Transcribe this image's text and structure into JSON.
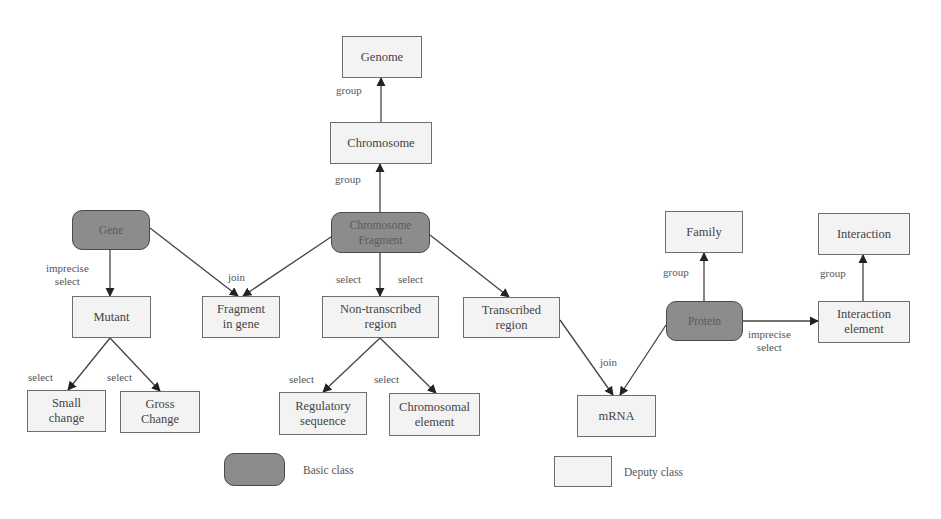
{
  "diagram": {
    "nodes": [
      {
        "id": "genome",
        "label": "Genome",
        "type": "deputy",
        "x": 342,
        "y": 36,
        "w": 80,
        "h": 42
      },
      {
        "id": "chromosome",
        "label": "Chromosome",
        "type": "deputy",
        "x": 330,
        "y": 122,
        "w": 102,
        "h": 42
      },
      {
        "id": "chromosome-fragment",
        "label": "Chromosome\nFragment",
        "type": "basic",
        "x": 331,
        "y": 212,
        "w": 99,
        "h": 41
      },
      {
        "id": "gene",
        "label": "Gene",
        "type": "basic",
        "x": 72,
        "y": 210,
        "w": 78,
        "h": 40
      },
      {
        "id": "mutant",
        "label": "Mutant",
        "type": "deputy",
        "x": 72,
        "y": 296,
        "w": 79,
        "h": 42
      },
      {
        "id": "fragment-in-gene",
        "label": "Fragment\nin gene",
        "type": "deputy",
        "x": 202,
        "y": 296,
        "w": 78,
        "h": 42
      },
      {
        "id": "non-transcribed-region",
        "label": "Non-transcribed\nregion",
        "type": "deputy",
        "x": 322,
        "y": 296,
        "w": 117,
        "h": 42
      },
      {
        "id": "transcribed-region",
        "label": "Transcribed\nregion",
        "type": "deputy",
        "x": 463,
        "y": 297,
        "w": 97,
        "h": 41
      },
      {
        "id": "family",
        "label": "Family",
        "type": "deputy",
        "x": 665,
        "y": 211,
        "w": 78,
        "h": 42
      },
      {
        "id": "interaction",
        "label": "Interaction",
        "type": "deputy",
        "x": 818,
        "y": 213,
        "w": 92,
        "h": 42
      },
      {
        "id": "protein",
        "label": "Protein",
        "type": "basic",
        "x": 666,
        "y": 301,
        "w": 77,
        "h": 40
      },
      {
        "id": "interaction-element",
        "label": "Interaction\nelement",
        "type": "deputy",
        "x": 818,
        "y": 301,
        "w": 92,
        "h": 42
      },
      {
        "id": "mrna",
        "label": "mRNA",
        "type": "deputy",
        "x": 577,
        "y": 395,
        "w": 79,
        "h": 42
      },
      {
        "id": "small-change",
        "label": "Small\nchange",
        "type": "deputy",
        "x": 27,
        "y": 390,
        "w": 79,
        "h": 42
      },
      {
        "id": "gross-change",
        "label": "Gross\nChange",
        "type": "deputy",
        "x": 120,
        "y": 391,
        "w": 80,
        "h": 42
      },
      {
        "id": "regulatory-sequence",
        "label": "Regulatory\nsequence",
        "type": "deputy",
        "x": 279,
        "y": 392,
        "w": 88,
        "h": 43
      },
      {
        "id": "chromosomal-element",
        "label": "Chromosomal\nelement",
        "type": "deputy",
        "x": 389,
        "y": 393,
        "w": 91,
        "h": 43
      }
    ],
    "edges": [
      {
        "from": "chromosome",
        "to": "genome",
        "points": [
          [
            381,
            122
          ],
          [
            381,
            78
          ]
        ]
      },
      {
        "from": "chromosome-fragment",
        "to": "chromosome",
        "points": [
          [
            380,
            212
          ],
          [
            380,
            164
          ]
        ]
      },
      {
        "from": "gene",
        "to": "mutant",
        "points": [
          [
            110,
            250
          ],
          [
            110,
            296
          ]
        ]
      },
      {
        "from": "gene",
        "to": "fragment-in-gene",
        "points": [
          [
            150,
            228
          ],
          [
            238,
            296
          ]
        ]
      },
      {
        "from": "chromosome-fragment",
        "to": "fragment-in-gene",
        "points": [
          [
            331,
            237
          ],
          [
            243,
            296
          ]
        ]
      },
      {
        "from": "chromosome-fragment",
        "to": "non-transcribed-region",
        "points": [
          [
            380,
            253
          ],
          [
            380,
            296
          ]
        ]
      },
      {
        "from": "chromosome-fragment",
        "to": "transcribed-region",
        "points": [
          [
            430,
            235
          ],
          [
            509,
            297
          ]
        ]
      },
      {
        "from": "mutant",
        "to": "small-change",
        "points": [
          [
            110,
            338
          ],
          [
            68,
            390
          ]
        ]
      },
      {
        "from": "mutant",
        "to": "gross-change",
        "points": [
          [
            110,
            338
          ],
          [
            160,
            391
          ]
        ]
      },
      {
        "from": "non-transcribed-region",
        "to": "regulatory-sequence",
        "points": [
          [
            380,
            338
          ],
          [
            323,
            392
          ]
        ]
      },
      {
        "from": "non-transcribed-region",
        "to": "chromosomal-element",
        "points": [
          [
            380,
            338
          ],
          [
            436,
            393
          ]
        ]
      },
      {
        "from": "transcribed-region",
        "to": "mrna",
        "points": [
          [
            560,
            320
          ],
          [
            613,
            395
          ]
        ]
      },
      {
        "from": "protein",
        "to": "mrna",
        "points": [
          [
            666,
            325
          ],
          [
            620,
            395
          ]
        ]
      },
      {
        "from": "protein",
        "to": "family",
        "points": [
          [
            704,
            301
          ],
          [
            704,
            253
          ]
        ]
      },
      {
        "from": "protein",
        "to": "interaction-element",
        "points": [
          [
            743,
            321
          ],
          [
            818,
            321
          ]
        ]
      },
      {
        "from": "interaction-element",
        "to": "interaction",
        "points": [
          [
            863,
            301
          ],
          [
            863,
            255
          ]
        ]
      }
    ],
    "edge_labels": [
      {
        "text": "group",
        "x": 336,
        "y": 84
      },
      {
        "text": "group",
        "x": 335,
        "y": 173
      },
      {
        "text": "imprecise\nselect",
        "x": 46,
        "y": 262
      },
      {
        "text": "join",
        "x": 228,
        "y": 271
      },
      {
        "text": "select",
        "x": 336,
        "y": 273
      },
      {
        "text": "select",
        "x": 398,
        "y": 273
      },
      {
        "text": "select",
        "x": 28,
        "y": 371
      },
      {
        "text": "select",
        "x": 107,
        "y": 371
      },
      {
        "text": "select",
        "x": 289,
        "y": 373
      },
      {
        "text": "select",
        "x": 374,
        "y": 373
      },
      {
        "text": "join",
        "x": 600,
        "y": 356
      },
      {
        "text": "group",
        "x": 663,
        "y": 266
      },
      {
        "text": "imprecise\nselect",
        "x": 748,
        "y": 328
      },
      {
        "text": "group",
        "x": 820,
        "y": 267
      }
    ],
    "legend": [
      {
        "type": "basic",
        "label": "Basic class",
        "box": {
          "x": 224,
          "y": 453,
          "w": 61,
          "h": 33
        },
        "label_x": 303,
        "label_y": 464
      },
      {
        "type": "deputy",
        "label": "Deputy class",
        "box": {
          "x": 554,
          "y": 456,
          "w": 58,
          "h": 31
        },
        "label_x": 624,
        "label_y": 466
      }
    ],
    "colors": {
      "basic_fill": "#8c8c8c",
      "basic_border": "#4a4a4a",
      "deputy_fill": "#f3f3f3",
      "deputy_border": "#6e6e6e",
      "edge": "#444444"
    }
  }
}
